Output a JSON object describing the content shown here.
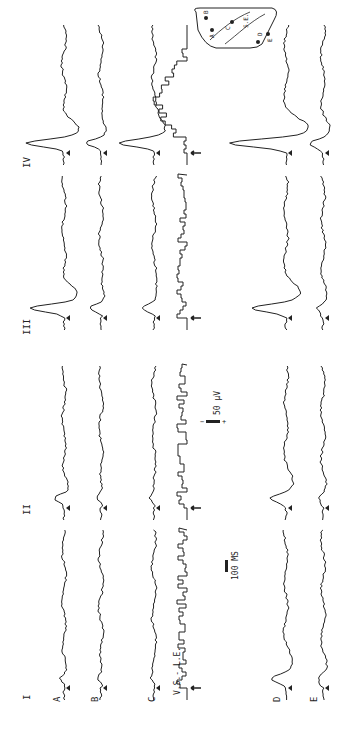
{
  "figure": {
    "orientation": "rotated-90-ccw",
    "columns": [
      {
        "label": "I",
        "y_start": 700,
        "y_end": 530
      },
      {
        "label": "II",
        "y_start": 520,
        "y_end": 365
      },
      {
        "label": "III",
        "y_start": 330,
        "y_end": 175
      },
      {
        "label": "IV",
        "y_start": 165,
        "y_end": 25
      }
    ],
    "rows": [
      {
        "label": "A",
        "x": 64
      },
      {
        "label": "B",
        "x": 101
      },
      {
        "label": "C",
        "x": 154
      },
      {
        "label": "V.S.- L.E.",
        "x": 187,
        "type": "histogram"
      },
      {
        "label": "D",
        "x": 286
      },
      {
        "label": "E",
        "x": 323
      }
    ],
    "scale_bars": {
      "time": "100 MS",
      "amplitude": "50 µV",
      "amplitude_polarity": [
        "−",
        "+"
      ]
    },
    "inset_labels": [
      "A",
      "B",
      "C",
      "D",
      "E",
      "S.E."
    ],
    "line_color": "#222222",
    "background": "#ffffff"
  }
}
